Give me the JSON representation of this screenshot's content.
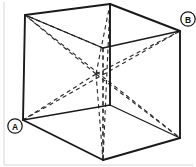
{
  "figure": {
    "background_color": "#ffffff",
    "line_color": "#1a1a1a",
    "dashed_line_color": "#2b2b2b",
    "frame_color": "#d8d6d2",
    "width": 196,
    "height": 167
  },
  "labels": {
    "a": "A",
    "b": "B"
  },
  "geometry": {
    "description": "Perspective drawing of a cube. Visible solid edges outline the near faces; hidden edges and the four space diagonals are drawn dashed, meeting at the cube center.",
    "vertices": {
      "top_back_left": [
        25,
        15
      ],
      "top_back_right": [
        110,
        4
      ],
      "top_front_right": [
        180,
        31
      ],
      "top_front_center": [
        103,
        48
      ],
      "bottom_back_left": [
        23,
        120
      ],
      "bottom_back_right": [
        103,
        160
      ],
      "bottom_front_right": [
        180,
        138
      ],
      "bottom_front_center": [
        103,
        105
      ]
    },
    "center": [
      96,
      74
    ]
  }
}
